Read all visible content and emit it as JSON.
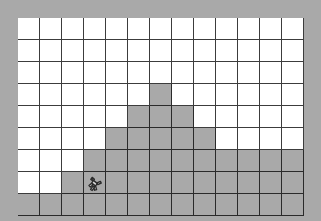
{
  "app": {
    "title": "Brick Pyramid Level",
    "canvas_width": 321,
    "canvas_height": 221
  },
  "colors": {
    "background": "#ffffff",
    "brick_face": "#a9a9a9",
    "brick_mortar": "#3f3f3f",
    "grid_line": "#444444",
    "frame_brick_face": "#a9a9a9",
    "frame_mortar": "#3a3a3a",
    "sprite_outline": "#2b2b2b",
    "sprite_fill": "#d8d8d8"
  },
  "board": {
    "origin_x": 18,
    "origin_y": 18,
    "cell_width": 22,
    "cell_height": 22,
    "columns": 13,
    "rows": 9,
    "frame_thickness": 18,
    "frame_label": "brick-border",
    "grid_visible": true
  },
  "level": {
    "name": "pyramid",
    "description": "Stepped brick pyramid rising from the floor",
    "floor_row": 8,
    "blocks": [
      {
        "row": 3,
        "cols": [
          6
        ]
      },
      {
        "row": 4,
        "cols": [
          5,
          6,
          7
        ]
      },
      {
        "row": 5,
        "cols": [
          4,
          5,
          6,
          7,
          8
        ]
      },
      {
        "row": 6,
        "cols": [
          3,
          4,
          5,
          6,
          7,
          8,
          9,
          10,
          11,
          12
        ]
      },
      {
        "row": 7,
        "cols": [
          2,
          3,
          4,
          5,
          6,
          7,
          8,
          9,
          10,
          11,
          12
        ]
      },
      {
        "row": 8,
        "cols": [
          0,
          1,
          2,
          3,
          4,
          5,
          6,
          7,
          8,
          9,
          10,
          11,
          12
        ]
      }
    ]
  },
  "player": {
    "name": "player-character",
    "col": 3,
    "row": 7,
    "facing": "right",
    "state": "standing"
  }
}
